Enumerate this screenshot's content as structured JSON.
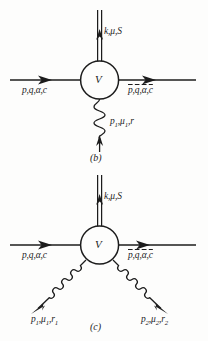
{
  "figure": {
    "background_color": "#fdfdfc",
    "ink_color": "#1c1c1c"
  },
  "diagrams": [
    {
      "caption": "(b)",
      "vertex_label": "V",
      "legs": {
        "photon_out_top": {
          "label": "k,μ,S",
          "line_style": "double-line",
          "direction": "up"
        },
        "fermion_in_left": {
          "label": "p,q,α,c",
          "line_style": "solid",
          "direction": "right"
        },
        "fermion_out_right": {
          "label": "p̄,q̄,ᾱ,c̄",
          "label_parts": [
            "p",
            "q",
            "α",
            "c"
          ],
          "line_style": "solid",
          "direction": "right"
        },
        "gluon_in_bottom": {
          "label": "p₁,μ₁,r",
          "line_style": "coil",
          "direction": "up"
        }
      }
    },
    {
      "caption": "(c)",
      "vertex_label": "V",
      "legs": {
        "photon_out_top": {
          "label": "k,μ,S",
          "line_style": "double-line",
          "direction": "up"
        },
        "fermion_in_left": {
          "label": "p,q,α,c",
          "line_style": "solid",
          "direction": "right"
        },
        "fermion_out_right": {
          "label": "p̄,q̄,ᾱ,c̄",
          "label_parts": [
            "p",
            "q",
            "α",
            "c"
          ],
          "line_style": "solid",
          "direction": "right"
        },
        "gluon_in_bottom_left": {
          "label": "p₁,μ₁,r₁",
          "line_style": "coil",
          "direction": "up-right"
        },
        "gluon_in_bottom_right": {
          "label": "p₂,μ₂,r₂",
          "line_style": "coil",
          "direction": "up-left"
        }
      }
    }
  ],
  "labels": {
    "k_mu_S_b": "k,μ,S",
    "pq_alpha_c_b": "p,q,α,c",
    "p1_mu1_r": "p₁,μ₁,r",
    "caption_b": "(b)",
    "vertex_b": "V",
    "k_mu_S_c": "k,μ,S",
    "pq_alpha_c_c": "p,q,α,c",
    "p1_mu1_r1": "p₁,μ₁,r₁",
    "p2_mu2_r2": "p₂,μ₂,r₂",
    "caption_c": "(c)",
    "vertex_c": "V"
  }
}
